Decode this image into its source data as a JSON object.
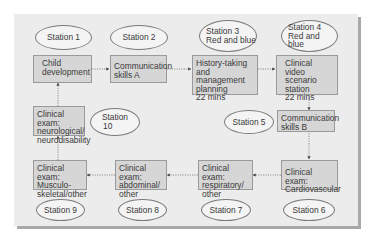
{
  "diagram": {
    "stations": [
      {
        "id": "station-1",
        "label": [
          "Station 1"
        ]
      },
      {
        "id": "station-2",
        "label": [
          "Station 2"
        ]
      },
      {
        "id": "station-3",
        "label": [
          "Station 3",
          "Red and blue"
        ]
      },
      {
        "id": "station-4",
        "label": [
          "Station 4",
          "Red and blue"
        ]
      },
      {
        "id": "station-5",
        "label": [
          "Station 5"
        ]
      },
      {
        "id": "station-6",
        "label": [
          "Station 6"
        ]
      },
      {
        "id": "station-7",
        "label": [
          "Station 7"
        ]
      },
      {
        "id": "station-8",
        "label": [
          "Station 8"
        ]
      },
      {
        "id": "station-9",
        "label": [
          "Station 9"
        ]
      },
      {
        "id": "station-10",
        "label": [
          "Station",
          "10"
        ]
      }
    ],
    "boxes": [
      {
        "id": "child-development",
        "lines": [
          "Child",
          "development"
        ]
      },
      {
        "id": "communication-skills-a",
        "lines": [
          "Communication",
          "skills A"
        ]
      },
      {
        "id": "history-taking",
        "lines": [
          "History-taking and",
          "management",
          "planning",
          "22 mins"
        ]
      },
      {
        "id": "clinical-video",
        "lines": [
          "Clinical video",
          "scenario",
          "station",
          "22 mins"
        ]
      },
      {
        "id": "communication-skills-b",
        "lines": [
          "Communication",
          "skills B"
        ]
      },
      {
        "id": "cardiovascular",
        "lines": [
          "Clinical exam:",
          "Cardiovascular"
        ]
      },
      {
        "id": "respiratory",
        "lines": [
          "Clinical exam:",
          "respiratory/",
          "other"
        ]
      },
      {
        "id": "abdominal",
        "lines": [
          "Clinical exam:",
          "abdominal/",
          "other"
        ]
      },
      {
        "id": "musculoskeletal",
        "lines": [
          "Clinical exam:",
          "Musculo-",
          "skeletal/other"
        ]
      },
      {
        "id": "neurological",
        "lines": [
          "Clinical exam:",
          "neurological/",
          "neurodisability"
        ]
      }
    ],
    "flow": [
      "child-development",
      "communication-skills-a",
      "history-taking",
      "clinical-video",
      "communication-skills-b",
      "cardiovascular",
      "respiratory",
      "abdominal",
      "musculoskeletal",
      "neurological",
      "child-development"
    ],
    "colors": {
      "panel": "#ececec",
      "box": "#d6d6d6",
      "border": "#9a9a9a",
      "shadow": "#a9a9a9"
    }
  }
}
